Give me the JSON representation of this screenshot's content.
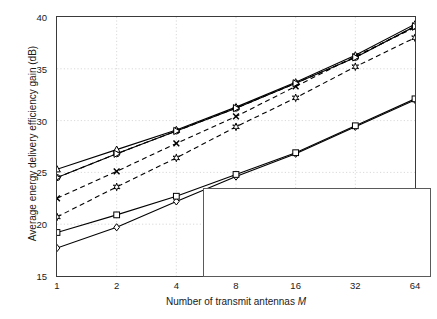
{
  "chart_data": {
    "type": "line",
    "title": "",
    "xlabel": "Number of  transmit antennas M",
    "ylabel": "Average energy delivery efficiency gain (dB)",
    "x": [
      1,
      2,
      4,
      8,
      16,
      32,
      64
    ],
    "xticklabels": [
      "1",
      "2",
      "4",
      "8",
      "16",
      "32",
      "64"
    ],
    "xscale": "log2",
    "xlim": [
      1,
      64
    ],
    "ylim": [
      15,
      40
    ],
    "yticks": [
      15,
      20,
      25,
      30,
      35,
      40
    ],
    "yticklabels": [
      "15",
      "20",
      "25",
      "30",
      "35",
      "40"
    ],
    "grid": true,
    "legend_position": "lower-right",
    "series": [
      {
        "name": "UWB SV  channel, nonperiodic",
        "marker": "diamond",
        "style": "solid",
        "values": [
          17.7,
          19.7,
          22.2,
          24.6,
          26.8,
          29.4,
          32.0
        ]
      },
      {
        "name": "UWB SV  channel,  periodic",
        "marker": "circle",
        "style": "solid",
        "values": [
          24.5,
          26.8,
          29.0,
          31.2,
          33.6,
          36.1,
          39.1
        ]
      },
      {
        "name": "UPD  channel (L=20), nonperiodic",
        "marker": "square",
        "style": "solid",
        "values": [
          19.2,
          20.9,
          22.7,
          24.8,
          26.9,
          29.5,
          32.1
        ]
      },
      {
        "name": "UPD  channel (L=20), periodic",
        "marker": "triangle",
        "style": "solid",
        "values": [
          25.3,
          27.2,
          29.1,
          31.3,
          33.7,
          36.3,
          39.3
        ]
      },
      {
        "name": "Frequency-domain beamforming (B = 10 MHz)",
        "marker": "hexagram",
        "style": "dashed",
        "values": [
          20.7,
          23.6,
          26.4,
          29.4,
          32.2,
          35.2,
          38.0
        ]
      },
      {
        "name": "Frequency-domain beamforming (B = 20 MHz)",
        "marker": "xcross",
        "style": "dashed",
        "values": [
          22.5,
          25.1,
          27.8,
          30.4,
          33.3,
          36.2,
          39.0
        ]
      },
      {
        "name": "Frequency-domain beamforming (B = 125 MHz)",
        "marker": "righttriangle",
        "style": "dashed",
        "values": [
          24.5,
          26.8,
          29.0,
          31.2,
          33.6,
          36.1,
          39.1
        ]
      }
    ]
  },
  "legend": {
    "items": [
      {
        "label": "UWB SV  channel, nonperiodic",
        "marker": "diamond",
        "style": "solid"
      },
      {
        "label": "UWB SV  channel,  periodic",
        "marker": "circle",
        "style": "solid"
      },
      {
        "label_pre": "UPD  channel (",
        "label_italic": "L",
        "label_post": "=20), nonperiodic",
        "marker": "square",
        "style": "solid"
      },
      {
        "label_pre": "UPD  channel (",
        "label_italic": "L",
        "label_post": "=20),  periodic",
        "marker": "triangle",
        "style": "solid"
      },
      {
        "label_pre": "Frequency−domain beamforming (",
        "label_italic": "B",
        "label_post": " = 10 MHz)",
        "marker": "hexagram",
        "style": "dashed"
      },
      {
        "label_pre": "Frequency−domain beamforming (",
        "label_italic": "B",
        "label_post": " = 20 MHz)",
        "marker": "xcross",
        "style": "dashed"
      },
      {
        "label_pre": "Frequency−domain beamforming (",
        "label_italic": "B",
        "label_post": " = 125 MHz)",
        "marker": "righttriangle",
        "style": "dashed"
      }
    ]
  },
  "axis": {
    "xlabel_pre": "Number of  transmit antennas ",
    "xlabel_italic": "M",
    "ylabel": "Average energy delivery efficiency gain (dB)"
  },
  "colors": {
    "line": "#000000",
    "axis": "#3a3a3a",
    "grid": "#cfcfcf",
    "background": "#ffffff"
  }
}
